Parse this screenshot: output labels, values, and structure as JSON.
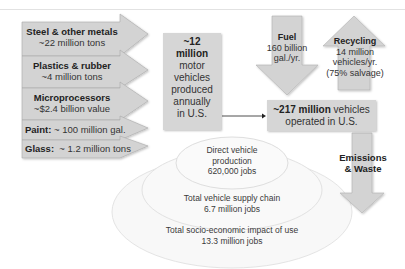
{
  "inputs": [
    {
      "title": "Steel & other metals",
      "value": "~22 million tons"
    },
    {
      "title": "Plastics & rubber",
      "value": "~4 million tons"
    },
    {
      "title": "Microprocessors",
      "value": "~$2.4 billion value"
    },
    {
      "title": "Paint:",
      "value": " ~ 100 million gal."
    },
    {
      "title": "Glass:",
      "value": "  ~ 1.2 million tons"
    }
  ],
  "production": {
    "line1": "~12",
    "line2": "million",
    "line3": "motor",
    "line4": "vehicles",
    "line5": "produced",
    "line6": "annually",
    "line7": "in U.S."
  },
  "fleet": {
    "bold": "~217 million",
    "rest": " vehicles",
    "line2": "operated in U.S."
  },
  "fuel": {
    "title": "Fuel",
    "line1": "160 billion",
    "line2": "gal./yr."
  },
  "recycling": {
    "title": "Recycling",
    "line1": "14 million",
    "line2": "vehicles/yr.",
    "line3": "(75% salvage)"
  },
  "emissions": {
    "line1": "Emissions",
    "line2": "& Waste"
  },
  "jobs": [
    {
      "line1": "Direct vehicle",
      "line2": "production",
      "line3": "620,000 jobs"
    },
    {
      "line1": "Total vehicle supply chain",
      "line2": "6.7 million jobs"
    },
    {
      "line1": "Total socio-economic impact of use",
      "line2": "13.3 million jobs"
    }
  ],
  "colors": {
    "arrow_fill": "#d3d3d3",
    "arrow_stroke": "#9a9a9a",
    "ring_fill": "#f7f7f7",
    "ring_stroke": "#e6e6e6"
  }
}
